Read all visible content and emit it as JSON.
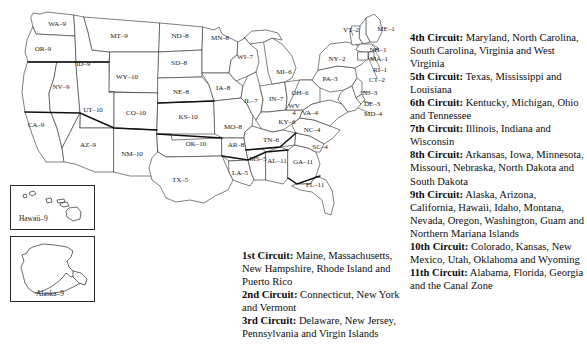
{
  "map": {
    "name": "us-circuit-map",
    "state_labels": [
      {
        "abbr": "WA",
        "circuit": "9",
        "text": "WA–9",
        "x": 57,
        "y": 25
      },
      {
        "abbr": "OR",
        "circuit": "9",
        "text": "OR–9",
        "x": 43,
        "y": 50
      },
      {
        "abbr": "CA",
        "circuit": "9",
        "text": "CA–9",
        "x": 36,
        "y": 126
      },
      {
        "abbr": "NV",
        "circuit": "9",
        "text": "NV–9",
        "x": 61,
        "y": 88
      },
      {
        "abbr": "ID",
        "circuit": "9",
        "text": "ID–9",
        "x": 83,
        "y": 65
      },
      {
        "abbr": "MT",
        "circuit": "9",
        "text": "MT–9",
        "x": 119,
        "y": 37
      },
      {
        "abbr": "WY",
        "circuit": "10",
        "text": "WY–10",
        "x": 127,
        "y": 78
      },
      {
        "abbr": "UT",
        "circuit": "10",
        "text": "UT–10",
        "x": 93,
        "y": 111
      },
      {
        "abbr": "AZ",
        "circuit": "9",
        "text": "AZ–9",
        "x": 88,
        "y": 146
      },
      {
        "abbr": "CO",
        "circuit": "10",
        "text": "CO–10",
        "x": 136,
        "y": 114
      },
      {
        "abbr": "NM",
        "circuit": "10",
        "text": "NM–10",
        "x": 132,
        "y": 155
      },
      {
        "abbr": "ND",
        "circuit": "8",
        "text": "ND–8",
        "x": 180,
        "y": 37
      },
      {
        "abbr": "SD",
        "circuit": "8",
        "text": "SD–8",
        "x": 179,
        "y": 64
      },
      {
        "abbr": "NE",
        "circuit": "8",
        "text": "NE–8",
        "x": 181,
        "y": 93
      },
      {
        "abbr": "KS",
        "circuit": "10",
        "text": "KS–10",
        "x": 188,
        "y": 118
      },
      {
        "abbr": "OK",
        "circuit": "10",
        "text": "OK–10",
        "x": 196,
        "y": 145
      },
      {
        "abbr": "TX",
        "circuit": "5",
        "text": "TX–5",
        "x": 180,
        "y": 181
      },
      {
        "abbr": "MN",
        "circuit": "8",
        "text": "MN–8",
        "x": 220,
        "y": 39
      },
      {
        "abbr": "IA",
        "circuit": "8",
        "text": "IA–8",
        "x": 223,
        "y": 89
      },
      {
        "abbr": "MO",
        "circuit": "8",
        "text": "MO–8",
        "x": 233,
        "y": 128
      },
      {
        "abbr": "AR",
        "circuit": "8",
        "text": "AR–8",
        "x": 236,
        "y": 146
      },
      {
        "abbr": "LA",
        "circuit": "5",
        "text": "LA–5",
        "x": 240,
        "y": 174
      },
      {
        "abbr": "WI",
        "circuit": "7",
        "text": "WI–7",
        "x": 245,
        "y": 58
      },
      {
        "abbr": "IL",
        "circuit": "7",
        "text": "IL–7",
        "x": 251,
        "y": 102
      },
      {
        "abbr": "IN",
        "circuit": "7",
        "text": "IN–7",
        "x": 276,
        "y": 100
      },
      {
        "abbr": "MI",
        "circuit": "6",
        "text": "MI–6",
        "x": 284,
        "y": 73
      },
      {
        "abbr": "OH",
        "circuit": "6",
        "text": "OH–6",
        "x": 300,
        "y": 94
      },
      {
        "abbr": "KY",
        "circuit": "6",
        "text": "KY–6",
        "x": 287,
        "y": 123
      },
      {
        "abbr": "TN",
        "circuit": "6",
        "text": "TN–6",
        "x": 271,
        "y": 141
      },
      {
        "abbr": "MS",
        "circuit": "5",
        "text": "MS–5",
        "x": 258,
        "y": 160
      },
      {
        "abbr": "AL",
        "circuit": "11",
        "text": "AL–11",
        "x": 277,
        "y": 162
      },
      {
        "abbr": "GA",
        "circuit": "11",
        "text": "GA–11",
        "x": 303,
        "y": 163
      },
      {
        "abbr": "FL",
        "circuit": "11",
        "text": "FL–11",
        "x": 315,
        "y": 186
      },
      {
        "abbr": "SC",
        "circuit": "4",
        "text": "SC–4",
        "x": 320,
        "y": 148
      },
      {
        "abbr": "NC",
        "circuit": "4",
        "text": "NC–4",
        "x": 312,
        "y": 131
      },
      {
        "abbr": "VA",
        "circuit": "4",
        "text": "VA–4",
        "x": 310,
        "y": 114
      },
      {
        "abbr": "WV",
        "circuit": "4",
        "text": "WV 4",
        "x": 294,
        "y": 110,
        "two_line": true
      },
      {
        "abbr": "MD",
        "circuit": "4",
        "text": "MD–4",
        "x": 373,
        "y": 115
      },
      {
        "abbr": "DE",
        "circuit": "3",
        "text": "DE–3",
        "x": 372,
        "y": 105
      },
      {
        "abbr": "NJ",
        "circuit": "3",
        "text": "NJ–3",
        "x": 370,
        "y": 94
      },
      {
        "abbr": "PA",
        "circuit": "3",
        "text": "PA–3",
        "x": 330,
        "y": 80
      },
      {
        "abbr": "NY",
        "circuit": "2",
        "text": "NY–2",
        "x": 337,
        "y": 60
      },
      {
        "abbr": "VT",
        "circuit": "2",
        "text": "VT–2",
        "x": 351,
        "y": 31
      },
      {
        "abbr": "NH",
        "circuit": "1",
        "text": "NH–1",
        "x": 378,
        "y": 51
      },
      {
        "abbr": "ME",
        "circuit": "1",
        "text": "ME–1",
        "x": 386,
        "y": 30
      },
      {
        "abbr": "MA",
        "circuit": "1",
        "text": "MA–1",
        "x": 379,
        "y": 60
      },
      {
        "abbr": "RI",
        "circuit": "1",
        "text": "RI–1",
        "x": 380,
        "y": 71
      },
      {
        "abbr": "CT",
        "circuit": "2",
        "text": "CT–2",
        "x": 377,
        "y": 81
      }
    ],
    "insets": [
      {
        "name": "hawaii-inset",
        "label": "Hawaii–9",
        "x": 10,
        "y": 185,
        "w": 85,
        "h": 45,
        "label_x": 18,
        "label_y": 215
      },
      {
        "name": "alaska-inset",
        "label": "Alaska–9",
        "x": 10,
        "y": 236,
        "w": 85,
        "h": 66,
        "label_x": 33,
        "label_y": 293
      }
    ]
  },
  "legend": {
    "left_column": [
      {
        "circuit": "1st Circuit:",
        "states": "Maine, Massachusetts, New Hampshire, Rhode Island and Puerto Rico"
      },
      {
        "circuit": "2nd Circuit:",
        "states": "Connecticut, New York and Vermont"
      },
      {
        "circuit": "3rd Circuit:",
        "states": "Delaware, New Jersey, Pennsylvania and Virgin Islands"
      }
    ],
    "right_column": [
      {
        "circuit": "4th Circuit:",
        "states": "Maryland, North Carolina, South Carolina, Virginia and West Virginia"
      },
      {
        "circuit": "5th Circuit:",
        "states": "Texas, Mississippi and Louisiana"
      },
      {
        "circuit": "6th Circuit:",
        "states": "Kentucky, Michigan, Ohio and Tennessee"
      },
      {
        "circuit": "7th Circuit:",
        "states": "Illinois, Indiana and Wisconsin"
      },
      {
        "circuit": "8th Circuit:",
        "states": "Arkansas, Iowa, Minnesota, Missouri, Nebraska, North Dakota and South Dakota"
      },
      {
        "circuit": "9th Circuit:",
        "states": "Alaska, Arizona, California, Hawaii, Idaho, Montana, Nevada, Oregon, Washington, Guam and Northern Mariana Islands"
      },
      {
        "circuit": "10th Circuit:",
        "states": "Colorado, Kansas, New Mexico, Utah, Oklahoma and Wyoming"
      },
      {
        "circuit": "11th Circuit:",
        "states": "Alabama, Florida, Georgia and the Canal Zone"
      }
    ]
  },
  "colors": {
    "background": "#ffffff",
    "state_border": "#3a3a3a",
    "circuit_border": "#111111",
    "text": "#0d0d0d"
  }
}
